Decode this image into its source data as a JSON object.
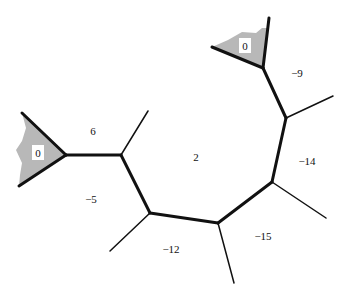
{
  "diagram": {
    "colors": {
      "line": "#111111",
      "shade": "#b8b8b8",
      "label_bg": "#ffffff"
    },
    "vertices": {
      "A": [
        66,
        155
      ],
      "B": [
        121,
        155
      ],
      "C": [
        150,
        213
      ],
      "D": [
        218,
        223
      ],
      "E": [
        272,
        182
      ],
      "F": [
        286,
        118
      ],
      "G": [
        263,
        68
      ]
    },
    "thick_edges": [
      [
        "A",
        "B"
      ],
      [
        "B",
        "C"
      ],
      [
        "C",
        "D"
      ],
      [
        "D",
        "E"
      ],
      [
        "E",
        "F"
      ],
      [
        "F",
        "G"
      ]
    ],
    "rays": [
      {
        "from": "A",
        "to": [
          22,
          113
        ],
        "weight": "thick"
      },
      {
        "from": "A",
        "to": [
          19,
          186
        ],
        "weight": "thick"
      },
      {
        "from": "B",
        "to": [
          148,
          111
        ],
        "weight": "thin"
      },
      {
        "from": "C",
        "to": [
          110,
          251
        ],
        "weight": "thin"
      },
      {
        "from": "D",
        "to": [
          234,
          283
        ],
        "weight": "thin"
      },
      {
        "from": "E",
        "to": [
          326,
          218
        ],
        "weight": "thin"
      },
      {
        "from": "F",
        "to": [
          333,
          96
        ],
        "weight": "thin"
      },
      {
        "from": "G",
        "to": [
          269,
          18
        ],
        "weight": "thick"
      },
      {
        "from": "G",
        "to": [
          212,
          47
        ],
        "weight": "thick"
      }
    ],
    "region_labels": [
      {
        "id": "left-cone",
        "text": "0",
        "x": 38,
        "y": 153,
        "boxed": true
      },
      {
        "id": "top-cone",
        "text": "0",
        "x": 245,
        "y": 46,
        "boxed": true
      },
      {
        "id": "r6",
        "text": "6",
        "x": 93,
        "y": 131
      },
      {
        "id": "rm5",
        "text": "−5",
        "x": 91,
        "y": 199
      },
      {
        "id": "r2",
        "text": "2",
        "x": 196,
        "y": 157
      },
      {
        "id": "rm12",
        "text": "−12",
        "x": 171,
        "y": 249
      },
      {
        "id": "rm15",
        "text": "−15",
        "x": 263,
        "y": 236
      },
      {
        "id": "rm14",
        "text": "−14",
        "x": 307,
        "y": 161
      },
      {
        "id": "rm9",
        "text": "−9",
        "x": 297,
        "y": 73
      }
    ]
  }
}
